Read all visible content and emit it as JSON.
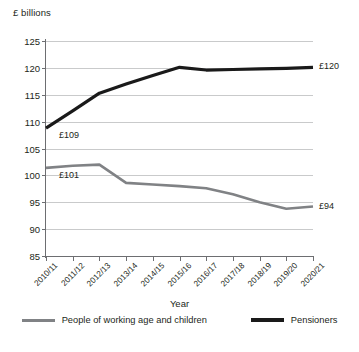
{
  "chart_data": {
    "type": "line",
    "title": "",
    "ylabel": "£ billions",
    "xlabel": "Year",
    "ylim": [
      85,
      125
    ],
    "yticks": [
      85,
      90,
      95,
      100,
      105,
      110,
      115,
      120,
      125
    ],
    "grid": true,
    "legend_position": "bottom",
    "categories": [
      "2010/11",
      "2011/12",
      "2012/13",
      "2013/14",
      "2014/15",
      "2015/16",
      "2016/17",
      "2017/18",
      "2018/19",
      "2019/20",
      "2020/21"
    ],
    "series": [
      {
        "name": "People of working age and children",
        "color": "#808285",
        "values": [
          101.4,
          101.8,
          102.0,
          98.6,
          98.3,
          98.0,
          97.6,
          96.5,
          95.0,
          93.8,
          94.2
        ],
        "point_labels": [
          {
            "index": 0,
            "text": "£101"
          },
          {
            "index": 10,
            "text": "£94"
          }
        ]
      },
      {
        "name": "Pensioners",
        "color": "#1a1a1a",
        "values": [
          108.8,
          112.0,
          115.3,
          117.0,
          118.6,
          120.1,
          119.6,
          119.7,
          119.8,
          119.9,
          120.1
        ],
        "point_labels": [
          {
            "index": 0,
            "text": "£109"
          },
          {
            "index": 10,
            "text": "£120"
          }
        ]
      }
    ],
    "legend": [
      {
        "label": "People of working age and children",
        "color": "#808285",
        "style": "grey"
      },
      {
        "label": "Pensioners",
        "color": "#1a1a1a",
        "style": "black"
      }
    ]
  }
}
